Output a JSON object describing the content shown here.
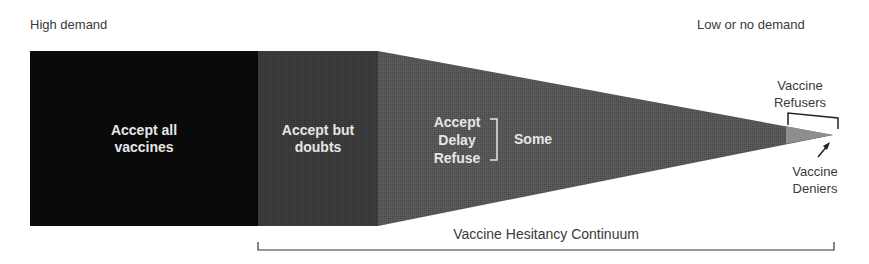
{
  "diagram": {
    "title": "Vaccine Hesitancy Continuum",
    "left_axis_label": "High demand",
    "right_axis_label": "Low or no demand",
    "segments": [
      {
        "label_line1": "Accept all",
        "label_line2": "vaccines",
        "color": "#0a0a0a"
      },
      {
        "label_line1": "Accept but",
        "label_line2": "doubts",
        "color": "#3a3a3a"
      },
      {
        "lines": [
          "Accept",
          "Delay",
          "Refuse"
        ],
        "bracket_label": "Some",
        "color": "#555555"
      },
      {
        "color": "#8a8a8a"
      }
    ],
    "callouts": {
      "refusers_line1": "Vaccine",
      "refusers_line2": "Refusers",
      "deniers_line1": "Vaccine",
      "deniers_line2": "Deniers"
    },
    "continuum_label": "Vaccine Hesitancy Continuum"
  }
}
